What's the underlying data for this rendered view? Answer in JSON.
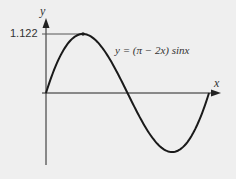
{
  "chart_data": {
    "type": "line",
    "title": "",
    "equation": "y = (π − 2x) sinx",
    "xlabel": "x",
    "ylabel": "y",
    "xlim": [
      0,
      3.1416
    ],
    "ylim": [
      -1.122,
      1.122
    ],
    "annotations": [
      {
        "label": "1.122",
        "x": 0.71,
        "y": 1.122,
        "note": "maximum point with dashed guide to y-axis"
      }
    ],
    "series": [
      {
        "name": "y = (π − 2x) sinx",
        "x": [
          0,
          0.2,
          0.4,
          0.6,
          0.71,
          0.8,
          1.0,
          1.2,
          1.4,
          1.5708,
          1.8,
          2.0,
          2.2,
          2.43,
          2.6,
          2.8,
          3.0,
          3.1416
        ],
        "y": [
          0,
          0.544,
          0.912,
          1.096,
          1.122,
          1.107,
          0.961,
          0.69,
          0.336,
          0,
          -0.446,
          -0.774,
          -1.015,
          -1.122,
          -1.057,
          -0.837,
          -0.428,
          0
        ]
      }
    ],
    "grid": false,
    "legend": null
  },
  "labels": {
    "y_axis": "y",
    "x_axis": "x",
    "max_value": "1.122",
    "equation": "y = (π − 2x) sinx"
  },
  "colors": {
    "background": "#efefef",
    "curve": "#1a1a1a",
    "axis": "#222222"
  }
}
